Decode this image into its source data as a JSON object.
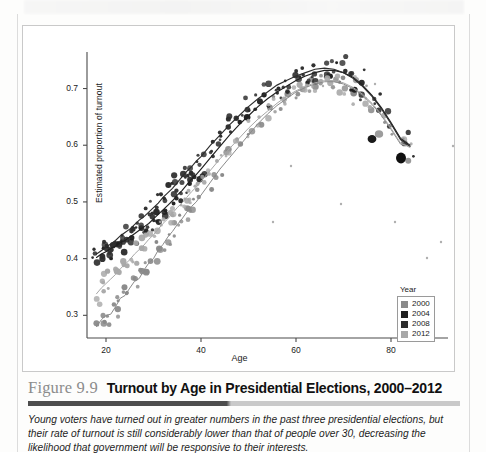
{
  "figure": {
    "number": "Figure 9.9",
    "title": "Turnout by Age in Presidential Elections, 2000–2012",
    "caption": "Young voters have turned out in greater numbers in the past three presidential elections, but their rate of turnout is still considerably lower than that of people over 30, decreasing the likelihood that government will be responsive to their interests."
  },
  "legend": {
    "title": "Year",
    "items": [
      {
        "label": "2000",
        "color": "#8a8a8a"
      },
      {
        "label": "2004",
        "color": "#202020"
      },
      {
        "label": "2008",
        "color": "#2d2d2d"
      },
      {
        "label": "2012",
        "color": "#a8a8a8"
      }
    ]
  },
  "chart_data": {
    "type": "scatter",
    "title": "Turnout by Age in Presidential Elections, 2000–2012",
    "xlabel": "Age",
    "ylabel": "Estimated proportion of turnout",
    "xlim": [
      16,
      92
    ],
    "ylim": [
      0.26,
      0.775
    ],
    "xticks": [
      20,
      40,
      60,
      80
    ],
    "yticks": [
      0.3,
      0.4,
      0.5,
      0.6,
      0.7
    ],
    "grid": false,
    "legend_position": "bottom-right",
    "series": [
      {
        "name": "2000",
        "color": "#8a8a8a",
        "x": [
          18,
          19,
          20,
          21,
          22,
          23,
          24,
          25,
          26,
          27,
          28,
          29,
          30,
          31,
          32,
          33,
          34,
          35,
          36,
          37,
          38,
          39,
          40,
          42,
          44,
          46,
          48,
          50,
          52,
          54,
          56,
          58,
          60,
          62,
          64,
          66,
          68,
          70,
          72,
          74,
          76,
          78,
          80,
          82,
          84
        ],
        "y": [
          0.28,
          0.292,
          0.3,
          0.302,
          0.315,
          0.33,
          0.335,
          0.348,
          0.36,
          0.365,
          0.38,
          0.392,
          0.4,
          0.415,
          0.425,
          0.438,
          0.448,
          0.46,
          0.47,
          0.482,
          0.492,
          0.5,
          0.512,
          0.535,
          0.558,
          0.578,
          0.598,
          0.618,
          0.638,
          0.655,
          0.67,
          0.682,
          0.694,
          0.702,
          0.708,
          0.712,
          0.712,
          0.708,
          0.7,
          0.688,
          0.672,
          0.652,
          0.628,
          0.602,
          0.598
        ],
        "fit_curve": true
      },
      {
        "name": "2004",
        "color": "#202020",
        "x": [
          18,
          19,
          20,
          21,
          22,
          23,
          24,
          25,
          26,
          27,
          28,
          29,
          30,
          31,
          32,
          33,
          34,
          35,
          36,
          37,
          38,
          39,
          40,
          42,
          44,
          46,
          48,
          50,
          52,
          54,
          56,
          58,
          60,
          62,
          64,
          66,
          68,
          70,
          72,
          74,
          76,
          78,
          80,
          82,
          84
        ],
        "y": [
          0.402,
          0.408,
          0.412,
          0.418,
          0.422,
          0.428,
          0.432,
          0.438,
          0.444,
          0.45,
          0.456,
          0.462,
          0.47,
          0.478,
          0.486,
          0.494,
          0.502,
          0.512,
          0.52,
          0.53,
          0.54,
          0.548,
          0.558,
          0.578,
          0.598,
          0.618,
          0.636,
          0.652,
          0.668,
          0.682,
          0.694,
          0.704,
          0.714,
          0.722,
          0.728,
          0.732,
          0.732,
          0.728,
          0.72,
          0.706,
          0.688,
          0.666,
          0.64,
          0.612,
          0.6
        ],
        "fit_curve": true
      },
      {
        "name": "2008",
        "color": "#2d2d2d",
        "x": [
          18,
          19,
          20,
          21,
          22,
          23,
          24,
          25,
          26,
          27,
          28,
          29,
          30,
          31,
          32,
          33,
          34,
          35,
          36,
          37,
          38,
          39,
          40,
          42,
          44,
          46,
          48,
          50,
          52,
          54,
          56,
          58,
          60,
          62,
          64,
          66,
          68,
          70,
          72,
          74,
          76,
          78,
          80,
          82,
          84
        ],
        "y": [
          0.408,
          0.414,
          0.42,
          0.426,
          0.432,
          0.44,
          0.446,
          0.452,
          0.46,
          0.468,
          0.474,
          0.482,
          0.49,
          0.498,
          0.508,
          0.516,
          0.524,
          0.534,
          0.544,
          0.554,
          0.562,
          0.572,
          0.58,
          0.6,
          0.618,
          0.636,
          0.652,
          0.668,
          0.682,
          0.694,
          0.706,
          0.714,
          0.722,
          0.728,
          0.734,
          0.736,
          0.734,
          0.728,
          0.718,
          0.704,
          0.686,
          0.664,
          0.638,
          0.61,
          0.598
        ],
        "fit_curve": true
      },
      {
        "name": "2012",
        "color": "#a8a8a8",
        "x": [
          18,
          19,
          20,
          21,
          22,
          23,
          24,
          25,
          26,
          27,
          28,
          29,
          30,
          31,
          32,
          33,
          34,
          35,
          36,
          37,
          38,
          39,
          40,
          42,
          44,
          46,
          48,
          50,
          52,
          54,
          56,
          58,
          60,
          62,
          64,
          66,
          68,
          70,
          72,
          74,
          76,
          78,
          80,
          82,
          84
        ],
        "y": [
          0.338,
          0.348,
          0.356,
          0.364,
          0.372,
          0.382,
          0.39,
          0.398,
          0.408,
          0.416,
          0.424,
          0.434,
          0.442,
          0.452,
          0.462,
          0.47,
          0.48,
          0.49,
          0.498,
          0.508,
          0.518,
          0.526,
          0.536,
          0.556,
          0.576,
          0.594,
          0.612,
          0.63,
          0.646,
          0.66,
          0.674,
          0.686,
          0.696,
          0.704,
          0.71,
          0.714,
          0.714,
          0.71,
          0.702,
          0.69,
          0.674,
          0.654,
          0.63,
          0.604,
          0.596
        ],
        "fit_curve": true
      }
    ]
  }
}
